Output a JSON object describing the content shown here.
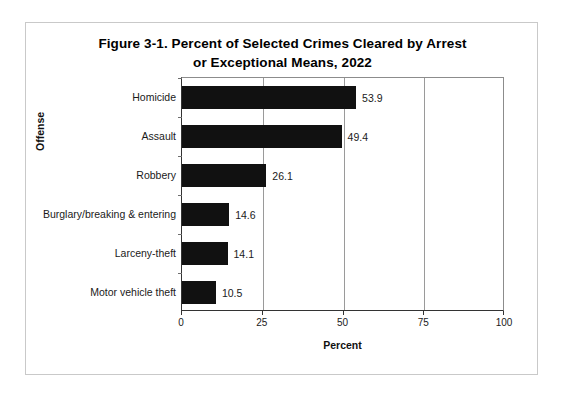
{
  "figure": {
    "title_line1": "Figure 3-1. Percent of Selected Crimes Cleared by Arrest",
    "title_line2": "or Exceptional Means, 2022"
  },
  "chart_data": {
    "type": "bar",
    "orientation": "horizontal",
    "title": "Figure 3-1. Percent of Selected Crimes Cleared by Arrest or Exceptional Means, 2022",
    "xlabel": "Percent",
    "ylabel": "Offense",
    "categories": [
      "Homicide",
      "Assault",
      "Robbery",
      "Burglary/breaking & entering",
      "Larceny-theft",
      "Motor vehicle theft"
    ],
    "values": [
      53.9,
      49.4,
      26.1,
      14.6,
      14.1,
      10.5
    ],
    "value_labels": [
      "53.9",
      "49.4",
      "26.1",
      "14.6",
      "14.1",
      "10.5"
    ],
    "xlim": [
      0,
      100
    ],
    "xticks": [
      0,
      25,
      50,
      75,
      100
    ],
    "xtick_labels": [
      "0",
      "25",
      "50",
      "75",
      "100"
    ],
    "grid": "vertical",
    "legend": "none",
    "bar_color": "#111111",
    "gridline_color": "#9a9a9a",
    "axis_color": "#333333",
    "background_color": "#ffffff"
  }
}
